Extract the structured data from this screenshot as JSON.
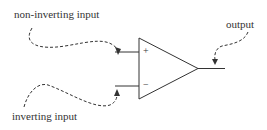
{
  "diagram": {
    "type": "op-amp schematic",
    "labels": {
      "non_inverting": "non-inverting input",
      "inverting": "inverting input",
      "output": "output",
      "plus": "+",
      "minus": "−"
    },
    "colors": {
      "stroke": "#333333",
      "background": "#ffffff"
    }
  }
}
